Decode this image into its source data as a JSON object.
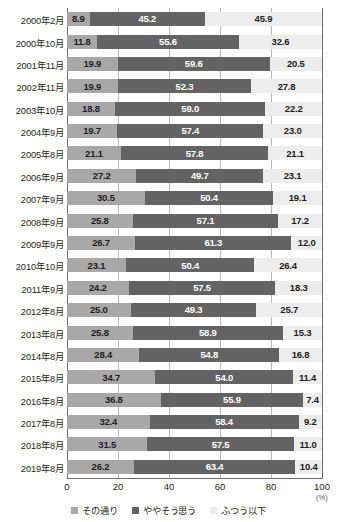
{
  "chart_data": {
    "type": "bar",
    "orientation": "horizontal",
    "stacked": true,
    "stack_total": 100,
    "title": "",
    "subtitle": "",
    "xlabel": "(%)",
    "ylabel": "",
    "xlim": [
      0,
      100
    ],
    "xticks": [
      0,
      20,
      40,
      60,
      80,
      100
    ],
    "xtick_labels": [
      "0",
      "20",
      "40",
      "60",
      "80",
      "100"
    ],
    "grid": true,
    "grid_axis": "x",
    "legend_position": "bottom",
    "categories": [
      "2000年2月",
      "2000年10月",
      "2001年11月",
      "2002年11月",
      "2003年10月",
      "2004年9月",
      "2005年8月",
      "2006年9月",
      "2007年9月",
      "2008年9月",
      "2009年9月",
      "2010年10月",
      "2011年9月",
      "2012年8月",
      "2013年8月",
      "2014年8月",
      "2015年8月",
      "2016年8月",
      "2017年8月",
      "2018年8月",
      "2019年8月"
    ],
    "series": [
      {
        "name": "その通り",
        "color": "#a8a8a8",
        "values": [
          8.9,
          11.8,
          19.9,
          19.9,
          18.8,
          19.7,
          21.1,
          27.2,
          30.5,
          25.8,
          26.7,
          23.1,
          24.2,
          25.0,
          25.8,
          28.4,
          34.7,
          36.8,
          32.4,
          31.5,
          26.2
        ]
      },
      {
        "name": "ややそう思う",
        "color": "#636363",
        "values": [
          45.2,
          55.6,
          59.6,
          52.3,
          59.0,
          57.4,
          57.8,
          49.7,
          50.4,
          57.1,
          61.3,
          50.4,
          57.5,
          49.3,
          58.9,
          54.8,
          54.0,
          55.9,
          58.4,
          57.5,
          63.4
        ]
      },
      {
        "name": "ふつう以下",
        "color": "#ededed",
        "values": [
          45.9,
          32.6,
          20.5,
          27.8,
          22.2,
          23.0,
          21.1,
          23.1,
          19.1,
          17.2,
          12.0,
          26.4,
          18.3,
          25.7,
          15.3,
          16.8,
          11.4,
          7.4,
          9.2,
          11.0,
          10.4
        ]
      }
    ],
    "value_label_format": "one-decimal"
  },
  "legend": {
    "items": [
      {
        "label": "その通り",
        "color": "#a8a8a8",
        "swatch_name": "legend-swatch-sonotoori"
      },
      {
        "label": "ややそう思う",
        "color": "#636363",
        "swatch_name": "legend-swatch-yayasoomou"
      },
      {
        "label": "ふつう以下",
        "color": "#ededed",
        "swatch_name": "legend-swatch-futsuuika"
      }
    ]
  },
  "axis": {
    "unit": "(%)"
  }
}
